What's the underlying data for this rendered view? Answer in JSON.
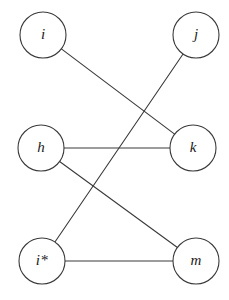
{
  "figure": {
    "type": "graph-diagram",
    "background_color": "#ffffff",
    "stroke_color": "#3a3a3a",
    "label_color": "#1a1a1a",
    "width": 229,
    "height": 300
  },
  "nodes": [
    {
      "id": "i",
      "label": "i",
      "cx": 43,
      "cy": 35,
      "r": 23
    },
    {
      "id": "j",
      "label": "j",
      "cx": 196,
      "cy": 35,
      "r": 23
    },
    {
      "id": "h",
      "label": "h",
      "cx": 41,
      "cy": 148,
      "r": 23
    },
    {
      "id": "k",
      "label": "k",
      "cx": 193,
      "cy": 148,
      "r": 23
    },
    {
      "id": "is",
      "label": "i*",
      "cx": 42,
      "cy": 261,
      "r": 23
    },
    {
      "id": "m",
      "label": "m",
      "cx": 196,
      "cy": 261,
      "r": 23
    }
  ],
  "edges": [
    {
      "id": "i-k",
      "from": "i",
      "to": "k",
      "label": "i–k"
    },
    {
      "id": "j-is",
      "from": "j",
      "to": "is",
      "label": "j–i*"
    },
    {
      "id": "h-k",
      "from": "h",
      "to": "k",
      "label": "h–k"
    },
    {
      "id": "h-m",
      "from": "h",
      "to": "m",
      "label": "h–m"
    },
    {
      "id": "is-m",
      "from": "is",
      "to": "m",
      "label": "i*–m"
    }
  ]
}
